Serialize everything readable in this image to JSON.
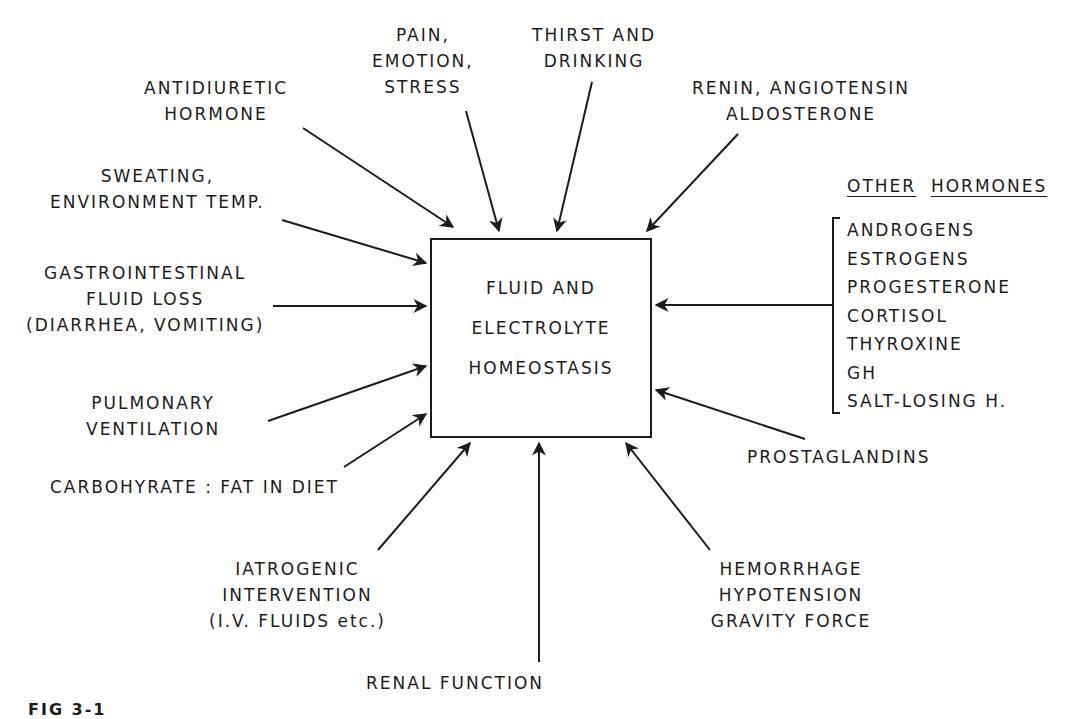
{
  "center": {
    "lines": [
      "FLUID AND",
      "ELECTROLYTE",
      "HOMEOSTASIS"
    ]
  },
  "factors": {
    "antidiuretic": [
      "ANTIDIURETIC",
      "HORMONE"
    ],
    "pain": [
      "PAIN,",
      "EMOTION,",
      "STRESS"
    ],
    "thirst": [
      "THIRST AND",
      "DRINKING"
    ],
    "renin": [
      "RENIN, ANGIOTENSIN",
      "ALDOSTERONE"
    ],
    "sweating": [
      "SWEATING,",
      "ENVIRONMENT  TEMP."
    ],
    "gastro": [
      "GASTROINTESTINAL",
      "FLUID LOSS",
      "(DIARRHEA, VOMITING)"
    ],
    "pulmonary": [
      "PULMONARY",
      "VENTILATION"
    ],
    "carbohydrate": "CARBOHYRATE : FAT  IN  DIET",
    "iatrogenic": [
      "IATROGENIC",
      "INTERVENTION",
      "(I.V.  FLUIDS  etc.)"
    ],
    "renal": "RENAL  FUNCTION",
    "hemorrhage": [
      "HEMORRHAGE",
      "HYPOTENSION",
      "GRAVITY  FORCE"
    ],
    "prostaglandins": "PROSTAGLANDINS"
  },
  "other_hormones": {
    "title_word1": "OTHER",
    "title_word2": "HORMONES",
    "items": [
      "ANDROGENS",
      "ESTROGENS",
      "PROGESTERONE",
      "CORTISOL",
      "THYROXINE",
      "GH",
      "SALT-LOSING  H."
    ]
  },
  "caption": "FIG 3-1"
}
